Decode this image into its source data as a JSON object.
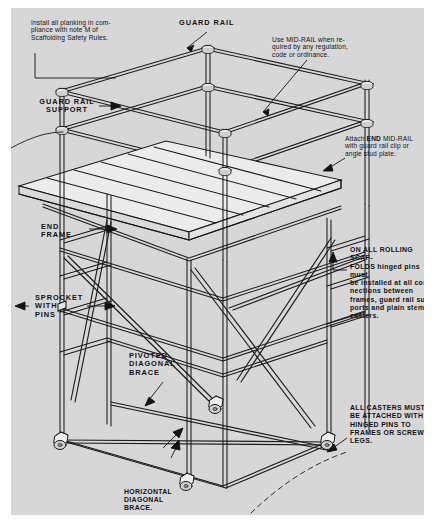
{
  "document": {
    "type": "technical-illustration",
    "subject": "Rolling scaffold tower assembly - isometric cutaway with safety callouts",
    "background_color": "#d8d8d8",
    "line_color": "#1a1a1a"
  },
  "annotations": {
    "planking": "Install all planking in com-\npliance with note M of\nScaffolding Safety Rules.",
    "guard_rail": "GUARD RAIL",
    "mid_rail": "Use MID-RAIL when re-\nquired by any regulation,\ncode or ordinance.",
    "guard_rail_support": "GUARD RAIL\nSUPPORT",
    "end_mid_rail_pre": "Attach ",
    "end_mid_rail_em": "END",
    "end_mid_rail_post": " MID-RAIL\nwith guard rail clip or\nangle stud plate.",
    "end_frame": "END\nFRAME",
    "sprocket": "SPROCKET\nWITH\nPINS",
    "rolling_scaffolds": "ON ALL ROLLING SCAF-\nFOLDS hinged pins must\nbe installed at all con-\nnections between\nframes, guard rail sup-\nports and plain stem\ncasters.",
    "pivoted_brace": "PIVOTED\nDIAGONAL\nBRACE",
    "casters": "ALL CASTERS MUST\nBE ATTACHED WITH\nHINGED PINS TO\nFRAMES OR SCREW\nLEGS.",
    "horizontal_brace_title": "HORIZONTAL\nDIAGONAL\nBRACE.",
    "horizontal_brace_body": "Install as low\nas possible\non frame leg\nor screw leg."
  },
  "parts": {
    "guard_rail": "guard-rail",
    "mid_rail": "mid-rail",
    "end_mid_rail": "end-mid-rail",
    "guard_rail_support": "guard-rail-support",
    "platform_planking": "platform-planking",
    "end_frame": "end-frame",
    "sprocket_with_pins": "sprocket-with-pins",
    "pivoted_diagonal_brace": "pivoted-diagonal-brace",
    "horizontal_diagonal_brace": "horizontal-diagonal-brace",
    "caster": "caster",
    "caster_count": 4
  }
}
